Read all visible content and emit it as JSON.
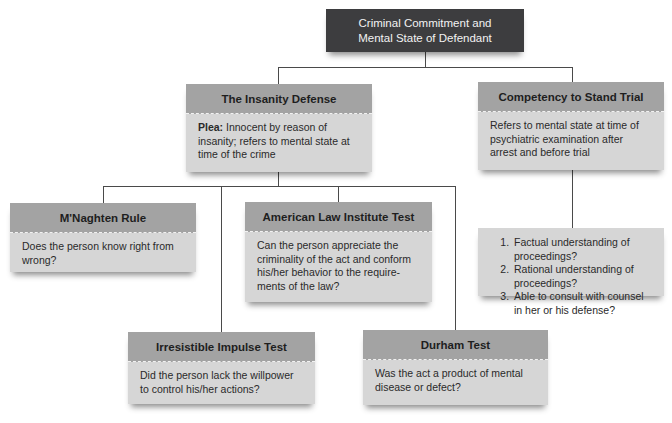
{
  "root": {
    "line1": "Criminal Commitment and",
    "line2": "Mental State of Defendant"
  },
  "insanity_defense": {
    "title": "The Insanity Defense",
    "plea_label": "Plea:",
    "plea_text": " Innocent by reason of insanity; refers to mental state at time of the crime"
  },
  "competency": {
    "title": "Competency to Stand Trial",
    "description": "Refers to mental state at time of psychiatric examination after arrest and before trial",
    "criteria": [
      "Factual understanding of proceedings?",
      "Rational understanding of proceedings?",
      "Able to consult with counsel in her or his defense?"
    ]
  },
  "tests": {
    "mnaghten": {
      "title": "M'Naghten Rule",
      "question": "Does the person know right from wrong?"
    },
    "ali": {
      "title": "American Law Institute Test",
      "question": "Can the person appreciate the criminality of the act and conform his/her behavior to the require-ments of the law?"
    },
    "irresistible": {
      "title": "Irresistible Impulse Test",
      "question": "Did the person lack the willpower to control his/her actions?"
    },
    "durham": {
      "title": "Durham Test",
      "question": "Was the act a product of mental disease or defect?"
    }
  },
  "colors": {
    "root_bg": "#3d3d3f",
    "header_bg": "#a3a3a3",
    "body_bg": "#d6d6d6",
    "connector": "#4a4a4a"
  }
}
